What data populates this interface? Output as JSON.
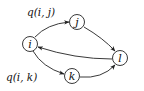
{
  "diagram": {
    "type": "directed-graph",
    "nodes": [
      {
        "id": "i",
        "label": "i",
        "x": 30,
        "y": 44
      },
      {
        "id": "j",
        "label": "j",
        "x": 77,
        "y": 22
      },
      {
        "id": "k",
        "label": "k",
        "x": 72,
        "y": 76
      },
      {
        "id": "l",
        "label": "l",
        "x": 120,
        "y": 58
      }
    ],
    "edges": [
      {
        "from": "i",
        "to": "j",
        "label": "q(i, j)"
      },
      {
        "from": "i",
        "to": "k",
        "label": "q(i, k)"
      },
      {
        "from": "j",
        "to": "l",
        "label": ""
      },
      {
        "from": "k",
        "to": "l",
        "label": ""
      },
      {
        "from": "l",
        "to": "i",
        "label": ""
      }
    ],
    "edge_labels": {
      "ij": "q(i, j)",
      "ik": "q(i, k)"
    },
    "colors": {
      "stroke": "#222222",
      "background": "#ffffff"
    }
  }
}
